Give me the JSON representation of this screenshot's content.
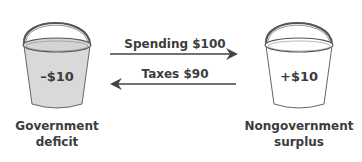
{
  "left_bucket": {
    "value_label": "–$10",
    "caption_line1": "Government",
    "caption_line2": "deficit",
    "fill_color": "#d9d9d9"
  },
  "right_bucket": {
    "value_label": "+$10",
    "caption_line1": "Nongovernment",
    "caption_line2": "surplus",
    "fill_color": "#ffffff"
  },
  "arrows": {
    "spending_label": "Spending $100",
    "taxes_label": "Taxes $90"
  }
}
